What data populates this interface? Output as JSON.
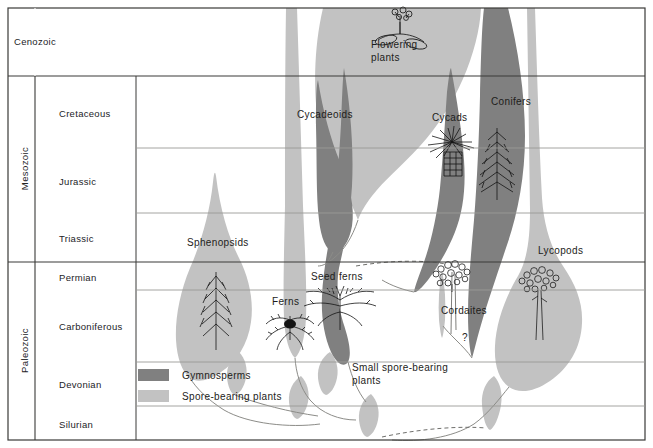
{
  "figure": {
    "title": "",
    "background": "#ffffff",
    "border_color": "#3a3a38",
    "grid_color": "#9a9a96",
    "text_color": "#23231f"
  },
  "colors": {
    "gymnosperm_gray": "#808080",
    "spore_gray": "#c2c2c2",
    "line_dark": "#3a3a38",
    "line_light": "#9a9a96",
    "illustration": "#1a1a1a"
  },
  "time_axis": {
    "eras": [
      {
        "name": "Cenozoic",
        "top": 8,
        "bottom": 76
      },
      {
        "name": "Mesozoic",
        "top": 76,
        "bottom": 262
      },
      {
        "name": "Paleozoic",
        "top": 262,
        "bottom": 440
      }
    ],
    "periods": [
      {
        "name": "Cretaceous",
        "top": 76,
        "bottom": 148
      },
      {
        "name": "Jurassic",
        "top": 148,
        "bottom": 213
      },
      {
        "name": "Triassic",
        "top": 213,
        "bottom": 262
      },
      {
        "name": "Permian",
        "top": 262,
        "bottom": 290
      },
      {
        "name": "Carboniferous",
        "top": 290,
        "bottom": 362
      },
      {
        "name": "Devonian",
        "top": 362,
        "bottom": 406
      },
      {
        "name": "Silurian",
        "top": 406,
        "bottom": 440
      }
    ]
  },
  "legend": {
    "items": [
      {
        "label": "Gymnosperms",
        "swatch": "#808080"
      },
      {
        "label": "Spore-bearing plants",
        "swatch": "#c2c2c2"
      }
    ]
  },
  "taxa": [
    {
      "id": "flowering-plants",
      "label": "Flowering\nplants",
      "line1": "Flowering",
      "line2": "plants",
      "group": "spore_band_light",
      "x": 375,
      "y": 44
    },
    {
      "id": "cycadeoids",
      "label": "Cycadeoids",
      "group": "gymnosperm",
      "x": 299,
      "y": 114
    },
    {
      "id": "cycads",
      "label": "Cycads",
      "group": "gymnosperm",
      "x": 433,
      "y": 117
    },
    {
      "id": "conifers",
      "label": "Conifers",
      "group": "gymnosperm",
      "x": 492,
      "y": 101
    },
    {
      "id": "sphenopsids",
      "label": "Sphenopsids",
      "group": "spore",
      "x": 189,
      "y": 242
    },
    {
      "id": "seed-ferns",
      "label": "Seed ferns",
      "group": "gymnosperm",
      "x": 312,
      "y": 276
    },
    {
      "id": "ferns",
      "label": "Ferns",
      "group": "spore",
      "x": 273,
      "y": 302
    },
    {
      "id": "cordaites",
      "label": "Cordaites",
      "group": "gymnosperm",
      "x": 443,
      "y": 310
    },
    {
      "id": "lycopods",
      "label": "Lycopods",
      "group": "spore",
      "x": 540,
      "y": 250
    },
    {
      "id": "small-spore-bearing-plants",
      "label": "Small spore-bearing\nplants",
      "line1": "Small spore-bearing",
      "line2": "plants",
      "group": "spore",
      "x": 355,
      "y": 367
    },
    {
      "id": "unknown-ancestor",
      "label": "?",
      "group": "unknown",
      "x": 464,
      "y": 337
    }
  ]
}
